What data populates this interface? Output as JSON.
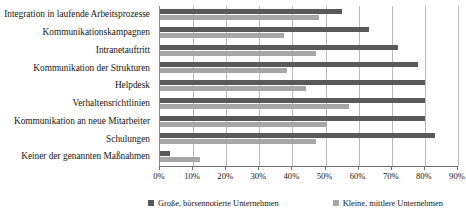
{
  "chart_data": {
    "type": "bar",
    "orientation": "horizontal",
    "title": "",
    "xlabel": "",
    "ylabel": "",
    "xlim": [
      0,
      90
    ],
    "xticks": [
      0,
      10,
      20,
      30,
      40,
      50,
      60,
      70,
      80,
      90
    ],
    "xtick_labels": [
      "0%",
      "10%",
      "20%",
      "30%",
      "40%",
      "50%",
      "60%",
      "70%",
      "80%",
      "90%"
    ],
    "grid": true,
    "legend_position": "bottom",
    "categories": [
      "Integration in laufende Arbeitsprozesse",
      "Kommunikationskampagnen",
      "Intranetauftritt",
      "Kommunikation der Strukturen",
      "Helpdesk",
      "Verhaltensrichtlinien",
      "Kommunikation an neue Mitarbeiter",
      "Schulungen",
      "Keiner der genannten Maßnahmen"
    ],
    "series": [
      {
        "name": "Große, börsennotierte Unternehmen",
        "color": "#595959",
        "values": [
          55,
          63,
          72,
          78,
          80,
          80,
          80,
          83,
          3
        ]
      },
      {
        "name": "Kleine, mittlere Unternehmen",
        "color": "#a6a6a6",
        "values": [
          48,
          37.5,
          47,
          38.5,
          44,
          57,
          50.5,
          47,
          12
        ]
      }
    ]
  },
  "colors": {
    "gridline": "#b9b9b9",
    "axis": "#6e6e6e",
    "text": "#141414",
    "background": "#ffffff"
  }
}
